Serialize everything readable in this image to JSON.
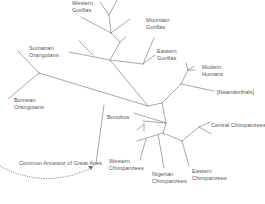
{
  "diagram": {
    "type": "unrooted phylogenetic tree",
    "subject": "Great Apes",
    "colors": {
      "background": "#ffffff",
      "branch": "#8a8a8a",
      "text": "#555555",
      "ancestor_arrow": "#6a6a6a"
    },
    "labels": {
      "western_gorillas": [
        "Western",
        "Gorillas"
      ],
      "mountain_gorillas": [
        "Mountain",
        "Gorillas"
      ],
      "eastern_gorillas": [
        "Eastern",
        "Gorillas"
      ],
      "sumatran_orangutans": [
        "Sumatran",
        "Orangutans"
      ],
      "bornean_orangutans": [
        "Bornean",
        "Orangutans"
      ],
      "modern_humans": [
        "Modern",
        "Humans"
      ],
      "neanderthals": "[Neanderthals]",
      "bonobos": "Bonobos",
      "central_chimpanzees": "Central Chimpanzees",
      "western_chimpanzees": [
        "Western",
        "Chimpanzees"
      ],
      "nigerian_chimpanzees": [
        "Nigerian",
        "Chimpanzees"
      ],
      "eastern_chimpanzees": [
        "Eastern",
        "Chimpanzees"
      ],
      "common_ancestor": "Common Ancestor of Great Apes"
    }
  }
}
